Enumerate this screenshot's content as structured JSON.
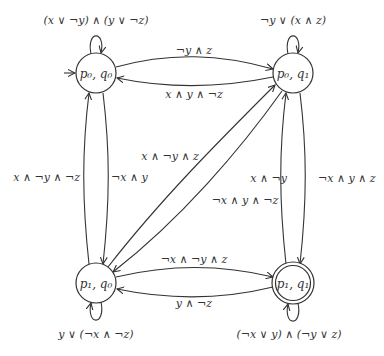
{
  "diagram": {
    "type": "automaton",
    "states": [
      {
        "id": "s00",
        "label": "p₀, q₀",
        "initial": true,
        "accepting": false,
        "self_loop": "(x ∨ ¬y) ∧ (y ∨ ¬z)"
      },
      {
        "id": "s01",
        "label": "p₀, q₁",
        "initial": false,
        "accepting": false,
        "self_loop": "¬y ∨ (x ∧ z)"
      },
      {
        "id": "s10",
        "label": "p₁, q₀",
        "initial": false,
        "accepting": false,
        "self_loop": "y ∨ (¬x ∧ ¬z)"
      },
      {
        "id": "s11",
        "label": "p₁, q₁",
        "initial": false,
        "accepting": true,
        "self_loop": "(¬x ∨ y) ∧ (¬y ∨ z)"
      }
    ],
    "transitions": [
      {
        "from": "s00",
        "to": "s01",
        "label": "¬y ∧ z"
      },
      {
        "from": "s01",
        "to": "s00",
        "label": "x ∧ y ∧ ¬z"
      },
      {
        "from": "s10",
        "to": "s00",
        "label": "x ∧ ¬y ∧ ¬z"
      },
      {
        "from": "s00",
        "to": "s10",
        "label": "¬x ∧ y"
      },
      {
        "from": "s11",
        "to": "s01",
        "label": "x ∧ ¬y"
      },
      {
        "from": "s01",
        "to": "s11",
        "label": "¬x ∧ y ∧ z"
      },
      {
        "from": "s10",
        "to": "s01",
        "label": "x ∧ ¬y ∧ z"
      },
      {
        "from": "s01",
        "to": "s10",
        "label": "¬x ∧ y ∧ ¬z"
      },
      {
        "from": "s10",
        "to": "s11",
        "label": "¬x ∧ ¬y ∧ z"
      },
      {
        "from": "s11",
        "to": "s10",
        "label": "y ∧ ¬z"
      }
    ]
  }
}
